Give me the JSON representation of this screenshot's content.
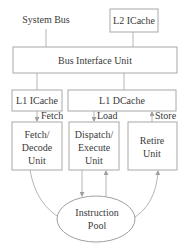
{
  "diagram": {
    "nodes": {
      "system_bus": "System Bus",
      "l2_icache": "L2 ICache",
      "bus_interface_unit": "Bus Interface Unit",
      "l1_icache": "L1 ICache",
      "l1_dcache": "L1 DCache",
      "fetch_decode": [
        "Fetch/",
        "Decode",
        "Unit"
      ],
      "dispatch_execute": [
        "Dispatch/",
        "Execute",
        "Unit"
      ],
      "retire": [
        "Retire",
        "Unit"
      ],
      "instruction_pool": [
        "Instruction",
        "Pool"
      ]
    },
    "edge_labels": {
      "fetch": "Fetch",
      "load": "Load",
      "store": "Store"
    },
    "colors": {
      "stroke": "#a8a8a8",
      "line": "#b5b5b5",
      "text": "#3a3a3a",
      "background": "#ffffff"
    }
  }
}
